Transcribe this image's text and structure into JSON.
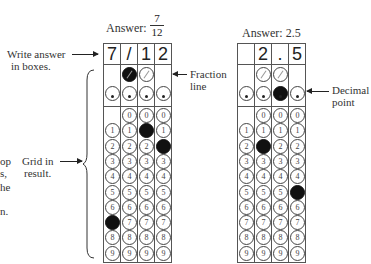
{
  "left_margin_fragments": [
    "op",
    "s,",
    "he",
    "n."
  ],
  "grid1": {
    "answer_label": "Answer:",
    "fraction_numerator": "7",
    "fraction_denominator": "12",
    "boxes": [
      "7",
      "/",
      "1",
      "2"
    ],
    "filled": {
      "fraction_col": 1,
      "decimal_col": null,
      "digits": [
        7,
        1,
        2
      ]
    }
  },
  "grid2": {
    "answer_label": "Answer: 2.5",
    "boxes": [
      "",
      "2",
      ".",
      "5"
    ],
    "filled": {
      "fraction_col": null,
      "decimal_col": 2,
      "digits": [
        null,
        2,
        null,
        5
      ]
    }
  },
  "annotations": {
    "write_answer": [
      "Write answer",
      "in boxes."
    ],
    "fraction_line": [
      "Fraction",
      "line"
    ],
    "decimal_point": [
      "Decimal",
      "point"
    ],
    "grid_in": [
      "Grid in",
      "result."
    ]
  },
  "digits": [
    "0",
    "1",
    "2",
    "3",
    "4",
    "5",
    "6",
    "7",
    "8",
    "9"
  ]
}
